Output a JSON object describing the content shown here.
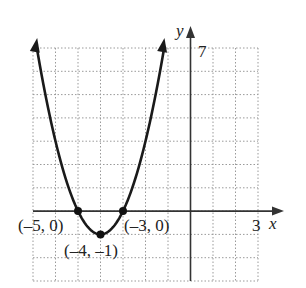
{
  "chart_data": {
    "type": "line",
    "title": "",
    "function": "y = (x + 4)^2 - 1",
    "xlabel": "x",
    "ylabel": "y",
    "xlim": [
      -7,
      3
    ],
    "ylim": [
      -3,
      7
    ],
    "grid": true,
    "grid_style": "dotted",
    "x_tick_labels": [
      {
        "value": 3,
        "label": "3"
      }
    ],
    "y_tick_labels": [
      {
        "value": 7,
        "label": "7"
      }
    ],
    "points": [
      {
        "x": -5,
        "y": 0,
        "label": "(–5, 0)"
      },
      {
        "x": -4,
        "y": -1,
        "label": "(–4, –1)"
      },
      {
        "x": -3,
        "y": 0,
        "label": "(–3, 0)"
      }
    ],
    "curve_color": "#1a1a1a",
    "axis_color": "#333333",
    "grid_color": "#9a9a9a"
  }
}
